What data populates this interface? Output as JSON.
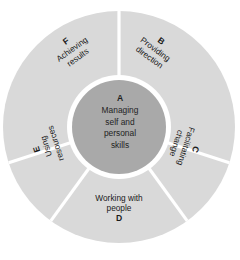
{
  "diagram": {
    "type": "radial-wheel",
    "colors": {
      "outer_ring": "#d9d9d9",
      "inner_circle": "#a9a9a9",
      "divider": "#ffffff",
      "background": "#ffffff",
      "text": "#1a1a1a"
    },
    "geometry": {
      "center_x": 119,
      "center_y": 127,
      "outer_radius": 116,
      "inner_radius": 47,
      "gap_radius": 52,
      "segment_count": 5
    },
    "core": {
      "letter": "A",
      "line1": "Managing",
      "line2": "self and",
      "line3": "personal",
      "line4": "skills"
    },
    "segments": [
      {
        "letter": "B",
        "line1": "Providing",
        "line2": "direction",
        "start_angle": 0,
        "end_angle": 72,
        "rotation": 36
      },
      {
        "letter": "C",
        "line1": "Facilitating",
        "line2": "change",
        "start_angle": 72,
        "end_angle": 144,
        "rotation": 108
      },
      {
        "letter": "D",
        "line1": "Working with",
        "line2": "people",
        "start_angle": 144,
        "end_angle": 216,
        "rotation": 180
      },
      {
        "letter": "E",
        "line1": "Using",
        "line2": "resources",
        "start_angle": 216,
        "end_angle": 288,
        "rotation": 252
      },
      {
        "letter": "F",
        "line1": "Achieving",
        "line2": "results",
        "start_angle": 288,
        "end_angle": 360,
        "rotation": 324
      }
    ]
  }
}
